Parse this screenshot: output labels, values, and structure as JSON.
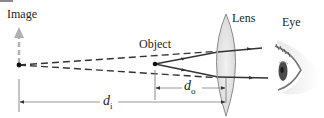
{
  "diagram": {
    "labels": {
      "image": "Image",
      "object": "Object",
      "lens": "Lens",
      "eye": "Eye",
      "d_o_main": "d",
      "d_o_sub": "o",
      "d_i_main": "d",
      "d_i_sub": "i"
    },
    "elements": [
      {
        "id": "image-point",
        "type": "virtual image",
        "x": 19,
        "y": 65
      },
      {
        "id": "object-point",
        "type": "object",
        "x": 155,
        "y": 64
      },
      {
        "id": "lens",
        "type": "converging lens",
        "x": 229
      },
      {
        "id": "eye",
        "type": "observer",
        "x": 290
      }
    ],
    "distances": [
      {
        "name": "d_o",
        "from": "object",
        "to": "lens"
      },
      {
        "name": "d_i",
        "from": "image",
        "to": "lens"
      }
    ],
    "colors": {
      "rays": "#333333",
      "dashed_rays": "#333333",
      "image_arrow": "#b0b0b0",
      "lens_fill": "#e6e6e6",
      "lens_stroke": "#8a8a8a",
      "dimension_lines": "#8a8a8a"
    }
  }
}
